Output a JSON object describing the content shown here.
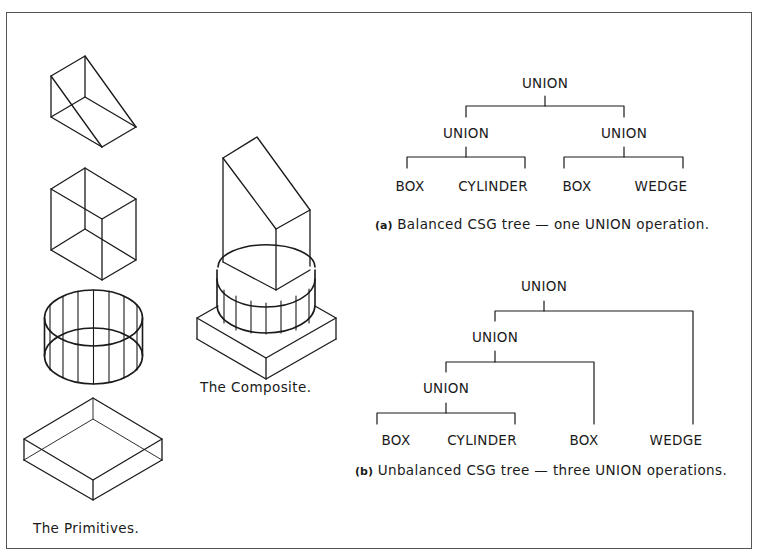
{
  "figure": {
    "primitives": {
      "caption": "The Primitives.",
      "items": [
        "wedge",
        "box",
        "cylinder",
        "box-flat"
      ]
    },
    "composite": {
      "caption": "The Composite."
    },
    "tree_a": {
      "root": "UNION",
      "left": "UNION",
      "right": "UNION",
      "leaves": [
        "BOX",
        "CYLINDER",
        "BOX",
        "WEDGE"
      ],
      "caption_prefix": "(a)",
      "caption": "Balanced CSG tree — one UNION operation."
    },
    "tree_b": {
      "root": "UNION",
      "level1": "UNION",
      "level2": "UNION",
      "leaves": [
        "BOX",
        "CYLINDER",
        "BOX",
        "WEDGE"
      ],
      "caption_prefix": "(b)",
      "caption": "Unbalanced CSG tree — three UNION operations."
    }
  },
  "colors": {
    "line": "#1a1a1a",
    "frame": "#555555",
    "background": "#ffffff"
  }
}
